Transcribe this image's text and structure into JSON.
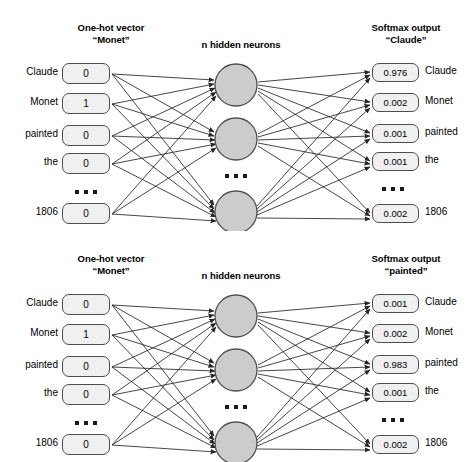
{
  "diagram": {
    "caption": "Word2Vec skip-gram network: one-hot input to softmax output",
    "colors": {
      "box_fill": "#f0f0f0",
      "box_stroke": "#4d4d4d",
      "neuron_fill": "#cccccc",
      "neuron_stroke": "#4d4d4d",
      "wire": "#262626",
      "text": "#000000"
    },
    "panels": [
      {
        "id": "top",
        "input_title_line1": "One-hot vector",
        "input_title_line2": "“Monet”",
        "hidden_title": "n hidden neurons",
        "output_title_line1": "Softmax output",
        "output_title_line2": "“Claude”",
        "input_rows": [
          {
            "label": "Claude",
            "value": "0"
          },
          {
            "label": "Monet",
            "value": "1"
          },
          {
            "label": "painted",
            "value": "0"
          },
          {
            "label": "the",
            "value": "0"
          },
          {
            "label": "1806",
            "value": "0"
          }
        ],
        "output_rows": [
          {
            "value": "0.976",
            "label": "Claude"
          },
          {
            "value": "0.002",
            "label": "Monet"
          },
          {
            "value": "0.001",
            "label": "painted"
          },
          {
            "value": "0.001",
            "label": "the"
          },
          {
            "value": "0.002",
            "label": "1806"
          }
        ],
        "hidden_count_symbol": "n",
        "ellipsis": "•••"
      },
      {
        "id": "bottom",
        "input_title_line1": "One-hot vector",
        "input_title_line2": "“Monet”",
        "hidden_title": "n hidden neurons",
        "output_title_line1": "Softmax output",
        "output_title_line2": "“painted”",
        "input_rows": [
          {
            "label": "Claude",
            "value": "0"
          },
          {
            "label": "Monet",
            "value": "1"
          },
          {
            "label": "painted",
            "value": "0"
          },
          {
            "label": "the",
            "value": "0"
          },
          {
            "label": "1806",
            "value": "0"
          }
        ],
        "output_rows": [
          {
            "value": "0.001",
            "label": "Claude"
          },
          {
            "value": "0.002",
            "label": "Monet"
          },
          {
            "value": "0.983",
            "label": "painted"
          },
          {
            "value": "0.001",
            "label": "the"
          },
          {
            "value": "0.002",
            "label": "1806"
          }
        ],
        "hidden_count_symbol": "n",
        "ellipsis": "•••"
      }
    ]
  }
}
